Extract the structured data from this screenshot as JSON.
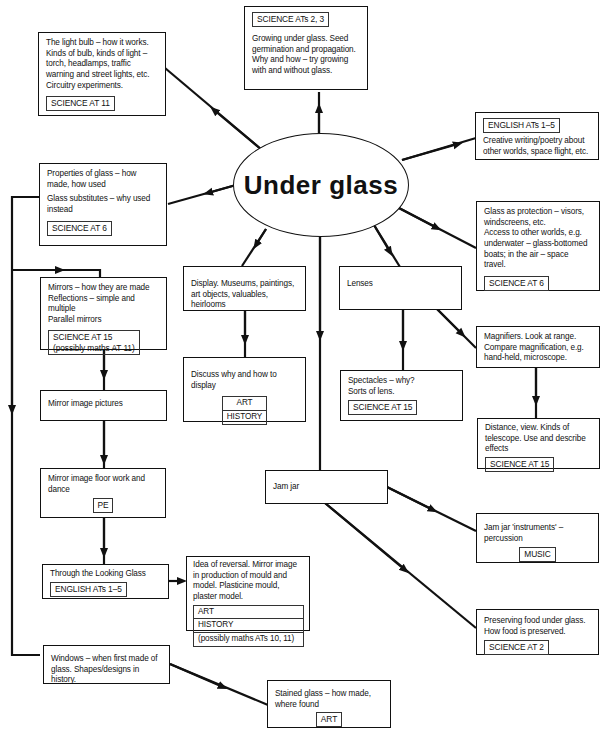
{
  "central_topic": "Under glass",
  "nodes": {
    "light_bulb": {
      "text": "The light bulb – how it works. Kinds of bulb, kinds of light – torch, headlamps, traffic warning and street lights, etc. Circuitry experiments.",
      "tag": "SCIENCE   AT 11"
    },
    "growing": {
      "tag": "SCIENCE ATs 2, 3",
      "text": "Growing under glass. Seed germination and propagation. Why and how – try growing with and without glass."
    },
    "english_creative": {
      "tag": "ENGLISH   ATs 1–5",
      "text": "Creative writing/poetry about other worlds, space flight, etc."
    },
    "properties": {
      "text1": "Properties of glass – how made, how used",
      "text2": "Glass substitutes – why used instead",
      "tag": "SCIENCE   AT 6"
    },
    "protection": {
      "text1": "Glass as protection – visors, windscreens, etc.",
      "text2": "Access to other worlds, e.g. underwater – glass-bottomed boats; in the air – space travel.",
      "tag": "SCIENCE   AT 6"
    },
    "mirrors": {
      "lines": [
        "Mirrors – how they are made",
        "Reflections – simple and multiple",
        "Parallel mirrors"
      ],
      "tag_lines": [
        "SCIENCE AT 15",
        "(possibly maths AT 11)"
      ]
    },
    "display": {
      "text": "Display. Museums, paintings, art objects, valuables, heirlooms"
    },
    "lenses": {
      "text": "Lenses"
    },
    "magnifiers": {
      "text": "Magnifiers. Look at range. Compare magnification, e.g. hand-held, microscope."
    },
    "discuss": {
      "text": "Discuss why and how to display",
      "tags": [
        "ART",
        "HISTORY"
      ]
    },
    "spectacles": {
      "text1": "Spectacles – why?",
      "text2": "Sorts of lens.",
      "tag": "SCIENCE AT 15"
    },
    "mirror_pictures": {
      "text": "Mirror image pictures"
    },
    "distance": {
      "text": "Distance, view. Kinds of telescope. Use and describe effects",
      "tag": "SCIENCE   AT 15"
    },
    "floor_work": {
      "text": "Mirror image floor work and dance",
      "tag": "PE"
    },
    "jam_jar": {
      "text": "Jam jar"
    },
    "jam_instruments": {
      "text": "Jam jar 'instruments' – percussion",
      "tag": "MUSIC"
    },
    "looking_glass": {
      "text": "Through the Looking Glass",
      "tag": "ENGLISH   ATs 1–5"
    },
    "reversal": {
      "text": "Idea of reversal. Mirror image in production of mould and model. Plasticine mould, plaster model.",
      "tags": [
        "ART",
        "HISTORY",
        "(possibly maths ATs 10, 11)"
      ]
    },
    "preserving": {
      "text": "Preserving food under glass. How food is preserved.",
      "tag": "SCIENCE   AT 2"
    },
    "windows": {
      "text": "Windows – when first made of glass. Shapes/designs in history."
    },
    "stained": {
      "text": "Stained glass – how made, where found",
      "tag": "ART"
    }
  }
}
